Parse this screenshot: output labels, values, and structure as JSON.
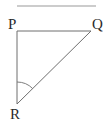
{
  "diagram": {
    "type": "right-triangle",
    "colors": {
      "line": "#6e6e6e",
      "top_rule": "#9a9a9a",
      "label": "#2a2a2a",
      "background": "#ffffff"
    },
    "top_rule": {
      "x1": 17,
      "y1": 6,
      "x2": 96,
      "y2": 6
    },
    "vertices": [
      {
        "name": "P",
        "label": "P",
        "x": 17,
        "y": 31,
        "label_x": 8,
        "label_y": 29
      },
      {
        "name": "Q",
        "label": "Q",
        "x": 91,
        "y": 31,
        "label_x": 92,
        "label_y": 29
      },
      {
        "name": "R",
        "label": "R",
        "x": 17,
        "y": 104,
        "label_x": 10,
        "label_y": 119
      }
    ],
    "edges": [
      {
        "from": "P",
        "to": "Q"
      },
      {
        "from": "P",
        "to": "R"
      },
      {
        "from": "R",
        "to": "Q"
      }
    ],
    "angle_marker": {
      "at": "R",
      "label": "angle PRQ",
      "radius": 22
    }
  }
}
